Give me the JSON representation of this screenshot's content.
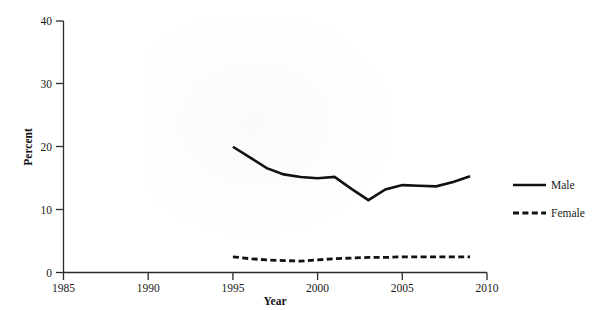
{
  "chart_data": {
    "type": "line",
    "title": "",
    "xlabel": "Year",
    "ylabel": "Percent",
    "xlim": [
      1985,
      2010
    ],
    "ylim": [
      0,
      40
    ],
    "xticks": [
      1985,
      1990,
      1995,
      2000,
      2005,
      2010
    ],
    "xtick_labels": [
      "1985",
      "1990",
      "1995",
      "2000",
      "2005",
      "2010"
    ],
    "yticks": [
      0,
      10,
      20,
      30,
      40
    ],
    "ytick_labels": [
      "0",
      "10",
      "20",
      "30",
      "40"
    ],
    "grid": false,
    "legend_position": "right",
    "x": [
      1995,
      1996,
      1997,
      1998,
      1999,
      2000,
      2001,
      2002,
      2003,
      2004,
      2005,
      2006,
      2007,
      2008,
      2009
    ],
    "series": [
      {
        "name": "Male",
        "style": "solid",
        "color": "#111111",
        "values": [
          20.0,
          18.3,
          16.6,
          15.6,
          15.2,
          15.0,
          15.2,
          13.3,
          11.5,
          13.2,
          13.9,
          13.8,
          13.7,
          14.4,
          15.3
        ]
      },
      {
        "name": "Female",
        "style": "dashed",
        "color": "#111111",
        "values": [
          2.5,
          2.2,
          2.0,
          1.9,
          1.8,
          2.0,
          2.2,
          2.3,
          2.4,
          2.4,
          2.5,
          2.5,
          2.5,
          2.5,
          2.5
        ]
      }
    ]
  },
  "axes": {
    "y_axis_title": "Percent",
    "x_axis_title": "Year"
  },
  "legend": {
    "items": [
      {
        "label": "Male",
        "style": "solid"
      },
      {
        "label": "Female",
        "style": "dashed"
      }
    ]
  },
  "xtick_labels": {
    "t0": "1985",
    "t1": "1990",
    "t2": "1995",
    "t3": "2000",
    "t4": "2005",
    "t5": "2010"
  },
  "ytick_labels": {
    "t0": "0",
    "t1": "10",
    "t2": "20",
    "t3": "30",
    "t4": "40"
  }
}
